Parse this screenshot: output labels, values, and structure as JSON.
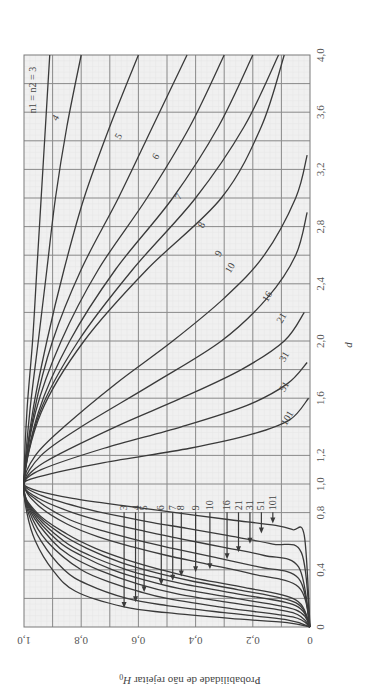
{
  "chart_data": {
    "type": "line",
    "title": "",
    "orientation": "rotated-90 (d runs vertically upward, probability runs horizontally with 1.0 at left)",
    "xlabel": "d",
    "ylabel": "Probabilidade de não rejeitar H0",
    "ylabel_main": "Probabilidade de não rejeitar ",
    "ylabel_symbol": "H",
    "ylabel_sub": "0",
    "xlim": [
      0,
      4.0
    ],
    "ylim": [
      0,
      1.0
    ],
    "x_ticks": [
      "0",
      "0,4",
      "0,8",
      "1,0",
      "1,2",
      "1,6",
      "2,0",
      "2,4",
      "2,8",
      "3,2",
      "3,6",
      "4,0"
    ],
    "x_tick_values": [
      0,
      0.4,
      0.8,
      1.0,
      1.2,
      1.6,
      2.0,
      2.4,
      2.8,
      3.2,
      3.6,
      4.0
    ],
    "y_ticks": [
      "0",
      "0,2",
      "0,4",
      "0,6",
      "0,8",
      "1,0"
    ],
    "y_tick_values": [
      0,
      0.2,
      0.4,
      0.6,
      0.8,
      1.0
    ],
    "grid": true,
    "legend_title": "n1 = n2 = 3",
    "series": [
      {
        "name": "3",
        "label": "n1 = n2 = 3",
        "points": [
          [
            0,
            0
          ],
          [
            0.03,
            0.08
          ],
          [
            0.06,
            0.28
          ],
          [
            0.1,
            0.5
          ],
          [
            0.14,
            0.65
          ],
          [
            0.25,
            0.82
          ],
          [
            0.4,
            0.9
          ],
          [
            0.6,
            0.96
          ],
          [
            0.8,
            0.99
          ],
          [
            1,
            1
          ],
          [
            1.5,
            0.99
          ],
          [
            2,
            0.97
          ],
          [
            2.5,
            0.955
          ],
          [
            3,
            0.94
          ],
          [
            3.5,
            0.925
          ],
          [
            4,
            0.91
          ]
        ]
      },
      {
        "name": "4",
        "label": "4",
        "points": [
          [
            0,
            0
          ],
          [
            0.05,
            0.08
          ],
          [
            0.1,
            0.3
          ],
          [
            0.15,
            0.5
          ],
          [
            0.2,
            0.64
          ],
          [
            0.3,
            0.78
          ],
          [
            0.4,
            0.86
          ],
          [
            0.6,
            0.94
          ],
          [
            0.8,
            0.985
          ],
          [
            1,
            1
          ],
          [
            1.5,
            0.98
          ],
          [
            2,
            0.95
          ],
          [
            2.5,
            0.92
          ],
          [
            3,
            0.89
          ],
          [
            3.5,
            0.85
          ],
          [
            4,
            0.8
          ]
        ]
      },
      {
        "name": "5",
        "label": "5",
        "points": [
          [
            0,
            0
          ],
          [
            0.07,
            0.06
          ],
          [
            0.13,
            0.28
          ],
          [
            0.2,
            0.5
          ],
          [
            0.25,
            0.6
          ],
          [
            0.3,
            0.68
          ],
          [
            0.4,
            0.8
          ],
          [
            0.6,
            0.92
          ],
          [
            0.8,
            0.98
          ],
          [
            1,
            1
          ],
          [
            1.5,
            0.97
          ],
          [
            2,
            0.92
          ],
          [
            2.5,
            0.86
          ],
          [
            3,
            0.79
          ],
          [
            3.5,
            0.7
          ],
          [
            4,
            0.6
          ]
        ]
      },
      {
        "name": "6",
        "label": "6",
        "points": [
          [
            0,
            0
          ],
          [
            0.1,
            0.06
          ],
          [
            0.17,
            0.28
          ],
          [
            0.23,
            0.46
          ],
          [
            0.3,
            0.6
          ],
          [
            0.4,
            0.74
          ],
          [
            0.5,
            0.84
          ],
          [
            0.6,
            0.9
          ],
          [
            0.8,
            0.975
          ],
          [
            1,
            1
          ],
          [
            1.5,
            0.965
          ],
          [
            2,
            0.9
          ],
          [
            2.5,
            0.8
          ],
          [
            3,
            0.67
          ],
          [
            3.5,
            0.55
          ],
          [
            4,
            0.43
          ]
        ]
      },
      {
        "name": "7",
        "label": "7",
        "points": [
          [
            0,
            0
          ],
          [
            0.12,
            0.05
          ],
          [
            0.2,
            0.26
          ],
          [
            0.27,
            0.46
          ],
          [
            0.33,
            0.58
          ],
          [
            0.4,
            0.69
          ],
          [
            0.5,
            0.8
          ],
          [
            0.6,
            0.88
          ],
          [
            0.8,
            0.97
          ],
          [
            1,
            1
          ],
          [
            1.5,
            0.96
          ],
          [
            2,
            0.87
          ],
          [
            2.5,
            0.74
          ],
          [
            3,
            0.57
          ],
          [
            3.5,
            0.42
          ],
          [
            4,
            0.3
          ]
        ]
      },
      {
        "name": "8",
        "label": "8",
        "points": [
          [
            0,
            0
          ],
          [
            0.15,
            0.05
          ],
          [
            0.23,
            0.25
          ],
          [
            0.3,
            0.44
          ],
          [
            0.35,
            0.55
          ],
          [
            0.4,
            0.64
          ],
          [
            0.5,
            0.77
          ],
          [
            0.6,
            0.86
          ],
          [
            0.8,
            0.965
          ],
          [
            1,
            1
          ],
          [
            1.5,
            0.95
          ],
          [
            2,
            0.84
          ],
          [
            2.5,
            0.68
          ],
          [
            3,
            0.48
          ],
          [
            3.5,
            0.32
          ],
          [
            4,
            0.2
          ]
        ]
      },
      {
        "name": "9",
        "label": "9",
        "points": [
          [
            0,
            0
          ],
          [
            0.17,
            0.05
          ],
          [
            0.26,
            0.25
          ],
          [
            0.32,
            0.41
          ],
          [
            0.38,
            0.54
          ],
          [
            0.45,
            0.66
          ],
          [
            0.55,
            0.78
          ],
          [
            0.65,
            0.87
          ],
          [
            0.8,
            0.96
          ],
          [
            1,
            1
          ],
          [
            1.5,
            0.945
          ],
          [
            2,
            0.81
          ],
          [
            2.5,
            0.62
          ],
          [
            3,
            0.4
          ],
          [
            3.5,
            0.23
          ],
          [
            4,
            0.11
          ]
        ]
      },
      {
        "name": "10",
        "label": "10",
        "points": [
          [
            0,
            0
          ],
          [
            0.19,
            0.05
          ],
          [
            0.28,
            0.24
          ],
          [
            0.34,
            0.4
          ],
          [
            0.4,
            0.52
          ],
          [
            0.47,
            0.64
          ],
          [
            0.55,
            0.75
          ],
          [
            0.65,
            0.85
          ],
          [
            0.8,
            0.955
          ],
          [
            1,
            1
          ],
          [
            1.5,
            0.94
          ],
          [
            2,
            0.79
          ],
          [
            2.5,
            0.57
          ],
          [
            3,
            0.31
          ],
          [
            3.5,
            0.17
          ],
          [
            4,
            0.09
          ]
        ]
      },
      {
        "name": "16",
        "label": "16",
        "points": [
          [
            0,
            0
          ],
          [
            0.28,
            0.04
          ],
          [
            0.37,
            0.2
          ],
          [
            0.44,
            0.36
          ],
          [
            0.5,
            0.5
          ],
          [
            0.56,
            0.62
          ],
          [
            0.63,
            0.74
          ],
          [
            0.72,
            0.85
          ],
          [
            0.85,
            0.95
          ],
          [
            1,
            1
          ],
          [
            1.2,
            0.96
          ],
          [
            1.4,
            0.86
          ],
          [
            1.7,
            0.68
          ],
          [
            2,
            0.48
          ],
          [
            2.3,
            0.3
          ],
          [
            2.6,
            0.16
          ],
          [
            3,
            0.05
          ],
          [
            3.3,
            0.01
          ]
        ]
      },
      {
        "name": "21",
        "label": "21",
        "points": [
          [
            0,
            0
          ],
          [
            0.34,
            0.04
          ],
          [
            0.42,
            0.18
          ],
          [
            0.49,
            0.34
          ],
          [
            0.55,
            0.48
          ],
          [
            0.6,
            0.59
          ],
          [
            0.67,
            0.72
          ],
          [
            0.75,
            0.84
          ],
          [
            0.88,
            0.95
          ],
          [
            1,
            1
          ],
          [
            1.2,
            0.94
          ],
          [
            1.4,
            0.8
          ],
          [
            1.7,
            0.55
          ],
          [
            2,
            0.31
          ],
          [
            2.3,
            0.15
          ],
          [
            2.6,
            0.05
          ],
          [
            2.9,
            0.01
          ]
        ]
      },
      {
        "name": "31",
        "label": "31",
        "points": [
          [
            0,
            0
          ],
          [
            0.42,
            0.04
          ],
          [
            0.5,
            0.16
          ],
          [
            0.56,
            0.31
          ],
          [
            0.62,
            0.46
          ],
          [
            0.67,
            0.58
          ],
          [
            0.73,
            0.71
          ],
          [
            0.8,
            0.83
          ],
          [
            0.9,
            0.95
          ],
          [
            1,
            1
          ],
          [
            1.15,
            0.93
          ],
          [
            1.4,
            0.68
          ],
          [
            1.6,
            0.45
          ],
          [
            1.8,
            0.24
          ],
          [
            2,
            0.09
          ],
          [
            2.2,
            0.02
          ]
        ]
      },
      {
        "name": "51",
        "label": "51",
        "points": [
          [
            0,
            0
          ],
          [
            0.52,
            0.03
          ],
          [
            0.58,
            0.13
          ],
          [
            0.64,
            0.29
          ],
          [
            0.69,
            0.43
          ],
          [
            0.73,
            0.55
          ],
          [
            0.78,
            0.68
          ],
          [
            0.84,
            0.81
          ],
          [
            0.92,
            0.94
          ],
          [
            1,
            1
          ],
          [
            1.1,
            0.94
          ],
          [
            1.25,
            0.72
          ],
          [
            1.4,
            0.45
          ],
          [
            1.55,
            0.22
          ],
          [
            1.7,
            0.08
          ],
          [
            1.85,
            0.01
          ]
        ]
      },
      {
        "name": "101",
        "label": "101",
        "points": [
          [
            0,
            0
          ],
          [
            0.64,
            0.02
          ],
          [
            0.68,
            0.06
          ],
          [
            0.71,
            0.12
          ],
          [
            0.75,
            0.28
          ],
          [
            0.8,
            0.47
          ],
          [
            0.85,
            0.66
          ],
          [
            0.9,
            0.83
          ],
          [
            0.95,
            0.95
          ],
          [
            1,
            1
          ],
          [
            1.05,
            0.95
          ],
          [
            1.15,
            0.72
          ],
          [
            1.25,
            0.42
          ],
          [
            1.35,
            0.2
          ],
          [
            1.45,
            0.07
          ],
          [
            1.6,
            0.005
          ]
        ]
      }
    ],
    "arrows": [
      {
        "label": "3",
        "target_d": 0.14,
        "target_p": 0.65
      },
      {
        "label": "4",
        "target_d": 0.18,
        "target_p": 0.61
      },
      {
        "label": "5",
        "target_d": 0.25,
        "target_p": 0.58
      },
      {
        "label": "6",
        "target_d": 0.3,
        "target_p": 0.52
      },
      {
        "label": "7",
        "target_d": 0.33,
        "target_p": 0.48
      },
      {
        "label": "8",
        "target_d": 0.36,
        "target_p": 0.45
      },
      {
        "label": "9",
        "target_d": 0.39,
        "target_p": 0.4
      },
      {
        "label": "10",
        "target_d": 0.41,
        "target_p": 0.35
      },
      {
        "label": "16",
        "target_d": 0.48,
        "target_p": 0.29
      },
      {
        "label": "21",
        "target_d": 0.53,
        "target_p": 0.25
      },
      {
        "label": "31",
        "target_d": 0.59,
        "target_p": 0.21
      },
      {
        "label": "51",
        "target_d": 0.66,
        "target_p": 0.17
      },
      {
        "label": "101",
        "target_d": 0.73,
        "target_p": 0.13
      }
    ],
    "upper_labels": [
      {
        "text": "4",
        "d": 3.55,
        "p": 0.88
      },
      {
        "text": "5",
        "d": 3.42,
        "p": 0.66
      },
      {
        "text": "6",
        "d": 3.28,
        "p": 0.53
      },
      {
        "text": "7",
        "d": 3.0,
        "p": 0.45
      },
      {
        "text": "8",
        "d": 2.8,
        "p": 0.37
      },
      {
        "text": "9",
        "d": 2.6,
        "p": 0.31
      },
      {
        "text": "10",
        "d": 2.5,
        "p": 0.27
      },
      {
        "text": "16",
        "d": 2.3,
        "p": 0.14
      },
      {
        "text": "21",
        "d": 2.15,
        "p": 0.09
      },
      {
        "text": "31",
        "d": 1.88,
        "p": 0.08
      },
      {
        "text": "51",
        "d": 1.67,
        "p": 0.08
      },
      {
        "text": "101",
        "d": 1.45,
        "p": 0.07
      }
    ]
  }
}
